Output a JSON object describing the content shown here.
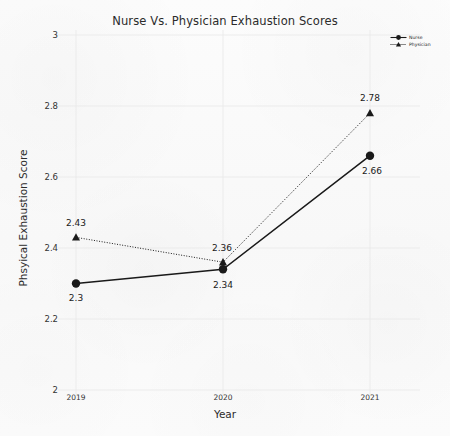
{
  "chart_data": {
    "type": "line",
    "title": "Nurse Vs. Physician Exhaustion Scores",
    "xlabel": "Year",
    "ylabel": "Phsyical Exhaustion Score",
    "categories": [
      "2019",
      "2020",
      "2021"
    ],
    "series": [
      {
        "name": "Nurse",
        "values": [
          2.3,
          2.34,
          2.66
        ],
        "labels": [
          "2.3",
          "2.34",
          "2.66"
        ],
        "marker": "circle",
        "linestyle": "solid",
        "color": "#1a1a1a"
      },
      {
        "name": "Physician",
        "values": [
          2.43,
          2.36,
          2.78
        ],
        "labels": [
          "2.43",
          "2.36",
          "2.78"
        ],
        "marker": "triangle",
        "linestyle": "dotted",
        "color": "#1a1a1a"
      }
    ],
    "ylim": [
      2,
      3
    ],
    "yticks": [
      "2",
      "2.2",
      "2.4",
      "2.6",
      "2.8",
      "3"
    ],
    "ytick_values": [
      2,
      2.2,
      2.4,
      2.6,
      2.8,
      3
    ],
    "grid": true,
    "legend_position": "top-right"
  },
  "legend": {
    "items": [
      {
        "label": "Nurse"
      },
      {
        "label": "Physician"
      }
    ]
  },
  "colors": {
    "background": "#fbfbfb",
    "ink": "#1a1a1a",
    "grid": "#e8e8e8",
    "text": "#2b2b2b"
  }
}
